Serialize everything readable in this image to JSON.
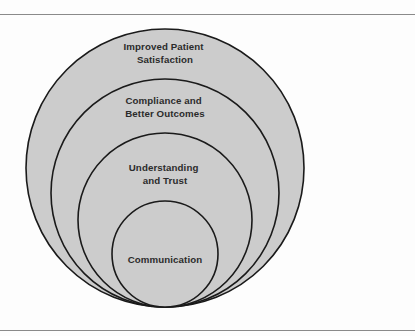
{
  "page": {
    "background_color": "#fdfdfd",
    "rule_color": "#8a8a8a"
  },
  "figure": {
    "type": "nested-circles-diagram",
    "fill_color": "#cccccc",
    "stroke_color": "#1a1a1a",
    "text_color": "#2b2b2b",
    "rings": [
      {
        "index": 1,
        "level": "outermost",
        "label_line1": "Improved Patient",
        "label_line2": "Satisfaction",
        "cx": 165,
        "cy": 152,
        "r": 139
      },
      {
        "index": 2,
        "level": "second",
        "label_line1": "Compliance and",
        "label_line2": "Better Outcomes",
        "cx": 165,
        "cy": 177,
        "r": 114
      },
      {
        "index": 3,
        "level": "third",
        "label_line1": "Understanding",
        "label_line2": "and Trust",
        "cx": 165,
        "cy": 204,
        "r": 87
      },
      {
        "index": 4,
        "level": "innermost",
        "label_line1": "Communication",
        "label_line2": "",
        "cx": 165,
        "cy": 238,
        "r": 53
      }
    ]
  }
}
